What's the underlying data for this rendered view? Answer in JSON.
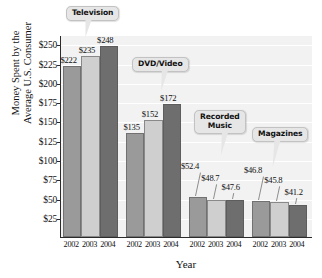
{
  "chart_data": {
    "type": "bar",
    "title": "",
    "xlabel": "Year",
    "ylabel": "Money Spent by the Average U.S. Consumer",
    "ylabel_lines": [
      "Money Spent by the",
      "Average U.S. Consumer"
    ],
    "ylim": [
      0,
      262
    ],
    "ytick_values": [
      25,
      50,
      75,
      100,
      125,
      150,
      175,
      200,
      225,
      250
    ],
    "ytick_labels": [
      "$25",
      "$50",
      "$75",
      "$100",
      "$125",
      "$150",
      "$175",
      "$200",
      "$225",
      "$250"
    ],
    "grid": true,
    "legend_position": "none",
    "categories": [
      "2002",
      "2003",
      "2004"
    ],
    "groups": [
      {
        "name": "Television",
        "values": [
          222,
          235,
          248
        ],
        "labels": [
          "$222",
          "$235",
          "$248"
        ],
        "xticks": [
          "2002",
          "2003",
          "2004"
        ]
      },
      {
        "name": "DVD/Video",
        "values": [
          135,
          152,
          172
        ],
        "labels": [
          "$135",
          "$152",
          "$172"
        ],
        "xticks": [
          "2002",
          "2003",
          "2004"
        ]
      },
      {
        "name": "Recorded Music",
        "name_lines": [
          "Recorded",
          "Music"
        ],
        "values": [
          52.4,
          48.7,
          47.6
        ],
        "labels": [
          "$52.4",
          "$48.7",
          "$47.6"
        ],
        "xticks": [
          "2002",
          "2003",
          "2004"
        ]
      },
      {
        "name": "Magazines",
        "values": [
          46.8,
          45.8,
          41.2
        ],
        "labels": [
          "$46.8",
          "$45.8",
          "$41.2"
        ],
        "xticks": [
          "2002",
          "2003",
          "2004"
        ]
      }
    ],
    "series_colors": {
      "2002": "#9a9a9a",
      "2003": "#cfcfcf",
      "2004": "#6e6e6e"
    },
    "plot_background": "#f2f2f2",
    "gridline_color": "#ffffff",
    "axis_color": "#2b2b2b",
    "callout_background": "#e6e6e6"
  }
}
